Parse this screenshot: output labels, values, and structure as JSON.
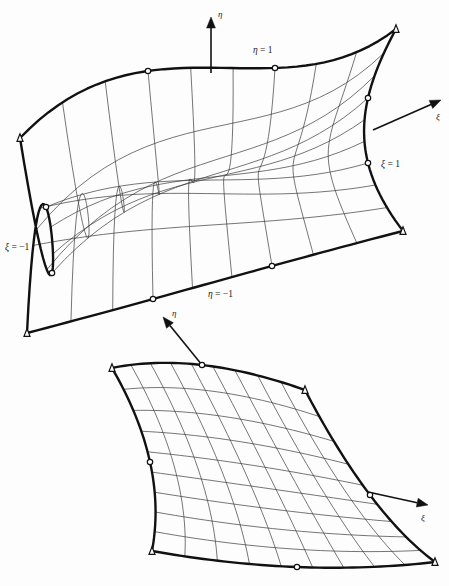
{
  "figure": {
    "kind": "geometry-diagram",
    "background_color": "#fdfdfd",
    "line_color": "#111111",
    "grid_color": "#3a3a3a",
    "node_fill": "#ffffff"
  },
  "labels": {
    "eta_symbol": "η",
    "xi_symbol": "ξ",
    "eta_equals_one": "η = 1",
    "eta_equals_minus_one": "η = −1",
    "xi_equals_one": "ξ = 1",
    "xi_equals_minus_one": "ξ = −1"
  },
  "elements": [
    {
      "name": "upper-element",
      "grid_divisions": {
        "xi": 9,
        "eta": 9
      },
      "nodes": {
        "corners": [
          {
            "id": "n1",
            "label": "ξ=−1, η=−1",
            "x": 27,
            "y": 333
          },
          {
            "id": "n2",
            "label": "ξ=1, η=−1",
            "x": 403,
            "y": 231
          },
          {
            "id": "n3",
            "label": "ξ=1, η=1",
            "x": 396,
            "y": 29
          },
          {
            "id": "n4",
            "label": "ξ=−1, η=1",
            "x": 20,
            "y": 138
          }
        ],
        "midsides": [
          {
            "id": "m12a",
            "edge": "eta=-1",
            "x": 153,
            "y": 299
          },
          {
            "id": "m12b",
            "edge": "eta=-1",
            "x": 272,
            "y": 266
          },
          {
            "id": "m23a",
            "edge": "xi=1",
            "x": 368,
            "y": 163
          },
          {
            "id": "m23b",
            "edge": "xi=1",
            "x": 368,
            "y": 98
          },
          {
            "id": "m34a",
            "edge": "eta=1",
            "x": 275,
            "y": 68
          },
          {
            "id": "m34b",
            "edge": "eta=1",
            "x": 148,
            "y": 71
          },
          {
            "id": "m41a",
            "edge": "xi=-1",
            "x": 52,
            "y": 273
          },
          {
            "id": "m41b",
            "edge": "xi=-1",
            "x": 46,
            "y": 207
          }
        ]
      },
      "annotations": [
        {
          "text": "η = 1",
          "x": 253,
          "y": 53,
          "anchor": "start"
        },
        {
          "text": "ξ = 1",
          "x": 381,
          "y": 167,
          "anchor": "start"
        },
        {
          "text": "ξ = −1",
          "x": 5,
          "y": 250,
          "anchor": "start"
        },
        {
          "text": "η = −1",
          "x": 208,
          "y": 297,
          "anchor": "start"
        }
      ],
      "axes": [
        {
          "name": "eta-axis-upper",
          "symbol": "η",
          "tail_x": 211,
          "tail_y": 73,
          "head_x": 211,
          "head_y": 17,
          "label_x": 218,
          "label_y": 17
        },
        {
          "name": "xi-axis-upper",
          "symbol": "ξ",
          "tail_x": 373,
          "tail_y": 130,
          "head_x": 441,
          "head_y": 100,
          "label_x": 436,
          "label_y": 120
        }
      ]
    },
    {
      "name": "lower-element",
      "grid_divisions": {
        "xi": 9,
        "eta": 9
      },
      "nodes": {
        "corners": [
          {
            "id": "n1",
            "label": "ξ=−1, η=−1",
            "x": 152,
            "y": 551
          },
          {
            "id": "n2",
            "label": "ξ=1, η=−1",
            "x": 435,
            "y": 562
          },
          {
            "id": "n3",
            "label": "ξ=1, η=1",
            "x": 305,
            "y": 390
          },
          {
            "id": "n4",
            "label": "ξ=−1, η=1",
            "x": 112,
            "y": 368
          }
        ],
        "midsides": [
          {
            "id": "m12a",
            "edge": "eta=-1",
            "x": 297,
            "y": 567
          },
          {
            "id": "m23a",
            "edge": "xi=1",
            "x": 370,
            "y": 495
          },
          {
            "id": "m34a",
            "edge": "eta=1",
            "x": 202,
            "y": 365
          },
          {
            "id": "m41a",
            "edge": "xi=-1",
            "x": 150,
            "y": 462
          }
        ]
      },
      "annotations": [],
      "axes": [
        {
          "name": "eta-axis-lower",
          "symbol": "η",
          "tail_x": 202,
          "tail_y": 365,
          "head_x": 163,
          "head_y": 317,
          "label_x": 172,
          "label_y": 316
        },
        {
          "name": "xi-axis-lower",
          "symbol": "ξ",
          "tail_x": 368,
          "tail_y": 492,
          "head_x": 428,
          "head_y": 505,
          "label_x": 421,
          "label_y": 521
        }
      ]
    }
  ]
}
